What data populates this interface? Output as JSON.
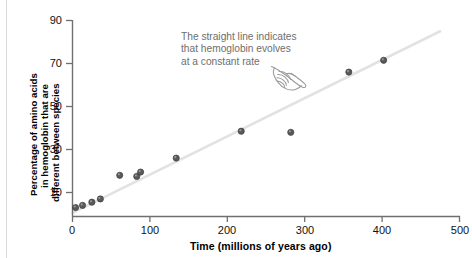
{
  "chart_data": {
    "type": "scatter",
    "title": "",
    "xlabel": "Time (millions of years ago)",
    "ylabel": "Percentage of amino acids in hemoglobin that are different between species",
    "ylabel_lines": [
      "Percentage of amino acids",
      "in hemoglobin that are",
      "different between species"
    ],
    "xlim": [
      0,
      500
    ],
    "ylim": [
      0,
      90
    ],
    "xticks": [
      0,
      100,
      200,
      300,
      400,
      500
    ],
    "yticks": [
      10,
      30,
      50,
      70,
      90
    ],
    "xtick_labels": [
      "0",
      "100",
      "200",
      "300",
      "400",
      "500"
    ],
    "ytick_labels": [
      "10",
      "30",
      "50",
      "70",
      "90"
    ],
    "grid": false,
    "legend": "none",
    "points": [
      {
        "x": 4,
        "y": 3.0
      },
      {
        "x": 13,
        "y": 4.0
      },
      {
        "x": 25,
        "y": 5.5
      },
      {
        "x": 36,
        "y": 7.0
      },
      {
        "x": 61,
        "y": 18.0
      },
      {
        "x": 83,
        "y": 17.5
      },
      {
        "x": 88,
        "y": 19.5
      },
      {
        "x": 134,
        "y": 26.0
      },
      {
        "x": 218,
        "y": 38.5
      },
      {
        "x": 282,
        "y": 38.0
      },
      {
        "x": 357,
        "y": 66.0
      },
      {
        "x": 402,
        "y": 71.5
      }
    ],
    "point_color": "#5a5a5a",
    "trendline": {
      "x0": 0,
      "y0": 0.5,
      "x1": 475,
      "y1": 85.0,
      "color": "#e2e2e2"
    },
    "axis_color": "#6f6f6f",
    "annotation": {
      "lines": [
        "The straight line indicates",
        "that hemoglobin evolves",
        "at a constant rate"
      ],
      "color": "#6e6e6e"
    }
  }
}
